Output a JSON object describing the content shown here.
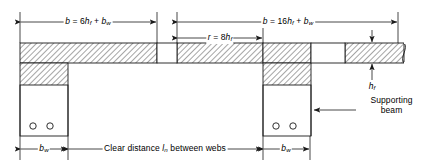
{
  "figure": {
    "type": "structural-cross-section-diagram",
    "stroke_color": "#1a1a1a",
    "hatch_color": "#555555",
    "background": "#ffffff"
  },
  "dimensions": {
    "top_left": {
      "name": "effective-width-left",
      "text_html": "<i>b</i> = 6<i>h</i><sub>f</sub> + <i>b</i><sub>w</sub>",
      "plain": "b = 6hf + bw",
      "x_start": 20,
      "x_end": 157,
      "y": 22
    },
    "top_right": {
      "name": "effective-width-right",
      "text_html": "<i>b</i> = 16<i>h</i><sub>f</sub> + <i>b</i><sub>w</sub>",
      "plain": "b = 16hf + bw",
      "x_start": 177,
      "x_end": 398,
      "y": 22
    },
    "overhang": {
      "name": "overhang-r",
      "text_html": "<i>r</i> = 8<i>h</i><sub>f</sub>",
      "plain": "r = 8hf",
      "x_start": 177,
      "x_end": 263,
      "y": 38
    },
    "flange_thickness": {
      "name": "flange-thickness-hf",
      "text_html": "<i>h</i><sub>f</sub>",
      "plain": "hf",
      "x": 372,
      "y_top": 44,
      "y_bottom": 62
    },
    "web_width_left": {
      "name": "web-width-left-bw",
      "text_html": "<i>b</i><sub>w</sub>",
      "plain": "bw",
      "x_start": 20,
      "x_end": 68,
      "y": 149
    },
    "web_width_right": {
      "name": "web-width-right-bw",
      "text_html": "<i>b</i><sub>w</sub>",
      "plain": "bw",
      "x_start": 263,
      "x_end": 310,
      "y": 149
    },
    "clear_distance": {
      "name": "clear-distance-ln",
      "text_html": "Clear distance <i>l</i><sub>n</sub> between webs",
      "plain": "Clear distance ln between webs",
      "x_start": 68,
      "x_end": 263,
      "y": 149
    }
  },
  "annotations": {
    "supporting_beam": {
      "name": "supporting-beam-callout",
      "line1": "Supporting",
      "line2": "beam",
      "arrow_from_x": 411,
      "arrow_to_x": 313,
      "arrow_y": 110,
      "text_x": 366,
      "text_y": 100
    }
  },
  "geometry": {
    "flange": {
      "top_y": 43,
      "bottom_y": 63,
      "segments": [
        {
          "name": "flange-segment-left",
          "x": 20,
          "width": 137
        },
        {
          "name": "flange-segment-mid",
          "x": 177,
          "width": 86
        },
        {
          "name": "flange-segment-right",
          "x": 263,
          "width": 48
        },
        {
          "name": "flange-segment-far",
          "x": 345,
          "width": 66
        }
      ],
      "gaps": [
        {
          "name": "flange-gap-joint-1",
          "x": 157,
          "width": 20
        },
        {
          "name": "flange-gap-joint-2",
          "x": 311,
          "width": 34
        }
      ]
    },
    "webs": [
      {
        "name": "web-left",
        "x": 20,
        "width": 48,
        "flange_bottom": 63,
        "stem_top": 85,
        "bottom_y": 136,
        "rebar": [
          {
            "cx": 33,
            "cy": 126
          },
          {
            "cx": 50,
            "cy": 126
          }
        ]
      },
      {
        "name": "web-right",
        "x": 263,
        "width": 48,
        "flange_bottom": 63,
        "stem_top": 85,
        "bottom_y": 136,
        "rebar": [
          {
            "cx": 276,
            "cy": 126
          },
          {
            "cx": 293,
            "cy": 126
          }
        ]
      }
    ],
    "break_symbol": {
      "name": "break-symbol-right-edge",
      "x": 404,
      "y_top": 43,
      "y_bottom": 63
    },
    "extension_lines": [
      {
        "name": "ext-line-x20",
        "x": 20,
        "y1": 12,
        "y2": 43
      },
      {
        "name": "ext-line-x157",
        "x": 157,
        "y1": 12,
        "y2": 43
      },
      {
        "name": "ext-line-x177",
        "x": 177,
        "y1": 12,
        "y2": 43
      },
      {
        "name": "ext-line-x263",
        "x": 263,
        "y1": 28,
        "y2": 43
      },
      {
        "name": "ext-line-x398",
        "x": 398,
        "y1": 12,
        "y2": 43
      },
      {
        "name": "ext-line-b-x20",
        "x": 20,
        "y1": 136,
        "y2": 160
      },
      {
        "name": "ext-line-b-x68",
        "x": 68,
        "y1": 136,
        "y2": 160
      },
      {
        "name": "ext-line-b-x263",
        "x": 263,
        "y1": 136,
        "y2": 160
      },
      {
        "name": "ext-line-b-x310",
        "x": 310,
        "y1": 136,
        "y2": 160
      }
    ]
  }
}
